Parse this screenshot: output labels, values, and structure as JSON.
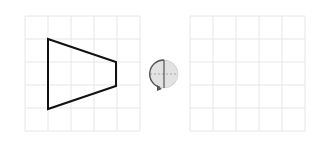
{
  "left_grid": {
    "x": 25,
    "y": 16,
    "cell": 23,
    "cols": 5,
    "rows": 5
  },
  "right_grid": {
    "x": 190,
    "y": 16,
    "cell": 23,
    "cols": 5,
    "rows": 5
  },
  "shape": {
    "type": "trapezoid",
    "points": [
      [
        48,
        39
      ],
      [
        116,
        62
      ],
      [
        116,
        86
      ],
      [
        48,
        109
      ]
    ]
  },
  "rotation_icon": {
    "cx": 164,
    "cy": 74,
    "r": 14,
    "direction": "counterclockwise"
  },
  "colors": {
    "grid": "#e6e6e6",
    "shape": "#111111",
    "icon_fill": "#dddddd",
    "icon_stroke": "#555555"
  }
}
